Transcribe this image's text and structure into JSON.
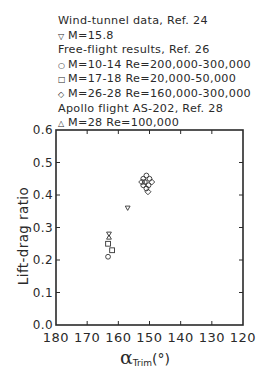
{
  "legend": {
    "rows": [
      {
        "symbol": "",
        "text": "Wind-tunnel data, Ref. 24"
      },
      {
        "symbol": "▽",
        "text": "M=15.8"
      },
      {
        "symbol": "",
        "text": "Free-flight results, Ref. 26"
      },
      {
        "symbol": "○",
        "text": "M=10-14  Re=200,000-300,000"
      },
      {
        "symbol": "□",
        "text": "M=17-18  Re=20,000-50,000"
      },
      {
        "symbol": "◇",
        "text": "M=26-28  Re=160,000-300,000"
      },
      {
        "symbol": "",
        "text": "Apollo flight AS-202, Ref. 28"
      },
      {
        "symbol": "△",
        "text": "M=28  Re=100,000"
      }
    ]
  },
  "axes": {
    "ylabel": "Lift-drag ratio",
    "xlabel_symbol": "α",
    "xlabel_sub": "Trim",
    "xlabel_unit": "(°)"
  },
  "chart_data": {
    "type": "scatter",
    "title": "",
    "xlabel": "α_Trim (°)",
    "ylabel": "Lift-drag ratio",
    "xlim": [
      180,
      120
    ],
    "ylim": [
      0.0,
      0.6
    ],
    "x_ticks": [
      180,
      170,
      160,
      150,
      140,
      130,
      120
    ],
    "y_ticks": [
      0.0,
      0.1,
      0.2,
      0.3,
      0.4,
      0.5,
      0.6
    ],
    "x_tick_labels": [
      "180",
      "170",
      "160",
      "150",
      "140",
      "130",
      "120"
    ],
    "y_tick_labels": [
      "0.0",
      "0.1",
      "0.2",
      "0.3",
      "0.4",
      "0.5",
      "0.6"
    ],
    "grid": false,
    "legend_position": "above plot",
    "series": [
      {
        "name": "Wind-tunnel data, Ref. 24: M=15.8",
        "marker": "triangle-down",
        "points": [
          [
            157,
            0.36
          ],
          [
            163,
            0.28
          ]
        ]
      },
      {
        "name": "Free-flight results, Ref. 26: M=10-14 Re=200,000-300,000",
        "marker": "circle",
        "points": [
          [
            163.3,
            0.21
          ],
          [
            151,
            0.46
          ],
          [
            152,
            0.45
          ],
          [
            150,
            0.45
          ],
          [
            151.5,
            0.44
          ],
          [
            150.3,
            0.43
          ],
          [
            151,
            0.42
          ],
          [
            152,
            0.43
          ]
        ]
      },
      {
        "name": "Free-flight results, Ref. 26: M=17-18 Re=20,000-50,000",
        "marker": "square",
        "points": [
          [
            163.3,
            0.25
          ],
          [
            162,
            0.23
          ]
        ]
      },
      {
        "name": "Free-flight results, Ref. 26: M=26-28 Re=160,000-300,000",
        "marker": "diamond",
        "points": [
          [
            149.3,
            0.44
          ],
          [
            152.5,
            0.44
          ],
          [
            150.5,
            0.41
          ]
        ]
      },
      {
        "name": "Apollo flight AS-202, Ref. 28: M=28 Re=100,000",
        "marker": "triangle-up",
        "points": [
          [
            163,
            0.27
          ]
        ]
      }
    ]
  }
}
